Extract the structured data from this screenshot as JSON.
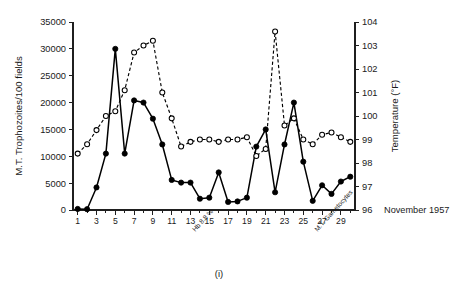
{
  "figure": {
    "label": "(i)",
    "date_axis_title": "November 1957"
  },
  "annotations": [
    {
      "text": "Hb 8.8 %",
      "day": 13.5
    },
    {
      "text": "M.T. Gametocytes",
      "day": 26.5
    }
  ],
  "chart_data": {
    "type": "line",
    "title": "",
    "xlabel": "November 1957",
    "x_ticks": [
      1,
      3,
      5,
      7,
      9,
      11,
      13,
      15,
      17,
      19,
      21,
      23,
      25,
      27,
      29
    ],
    "x_minor_step": 1,
    "xlim": [
      0.5,
      30.5
    ],
    "grid": false,
    "legend": "none",
    "axes": [
      {
        "id": "left",
        "ylabel": "M.T. Trophozoites/100 fields",
        "ticks": [
          0,
          5000,
          10000,
          15000,
          20000,
          25000,
          30000,
          35000
        ],
        "ylim": [
          0,
          35000
        ]
      },
      {
        "id": "right",
        "ylabel": "Temperature (°F)",
        "ticks": [
          96,
          97,
          98,
          99,
          100,
          101,
          102,
          103,
          104
        ],
        "ylim": [
          96,
          104
        ]
      }
    ],
    "series": [
      {
        "name": "M.T. Trophozoites/100 fields",
        "axis": "left",
        "marker": "filled-circle",
        "linestyle": "solid",
        "color": "#000000",
        "x": [
          1,
          2,
          3,
          4,
          5,
          6,
          7,
          8,
          9,
          10,
          11,
          12,
          13,
          14,
          15,
          16,
          17,
          18,
          19,
          20,
          21,
          22,
          23,
          24,
          25,
          26,
          27,
          28,
          29,
          30
        ],
        "values": [
          200,
          150,
          4200,
          10500,
          30000,
          10500,
          20400,
          20000,
          17000,
          12200,
          5600,
          5100,
          5100,
          2100,
          2300,
          7000,
          1500,
          1600,
          2300,
          11800,
          15000,
          3300,
          12200,
          20000,
          9000,
          1700,
          4600,
          3000,
          5300,
          6200
        ]
      },
      {
        "name": "Temperature (°F)",
        "axis": "right",
        "marker": "open-circle",
        "linestyle": "dashed",
        "color": "#000000",
        "x": [
          1,
          2,
          3,
          4,
          5,
          6,
          7,
          8,
          9,
          10,
          11,
          12,
          13,
          14,
          15,
          16,
          17,
          18,
          19,
          20,
          21,
          22,
          23,
          24,
          25,
          26,
          27,
          28,
          29,
          30
        ],
        "values": [
          98.4,
          98.8,
          99.4,
          100.0,
          100.2,
          101.1,
          102.7,
          103.0,
          103.2,
          101.0,
          99.9,
          98.7,
          98.9,
          99.0,
          99.0,
          98.9,
          99.0,
          99.0,
          99.1,
          98.3,
          98.6,
          103.6,
          99.6,
          99.9,
          99.0,
          98.8,
          99.2,
          99.3,
          99.1,
          98.9
        ]
      }
    ]
  }
}
